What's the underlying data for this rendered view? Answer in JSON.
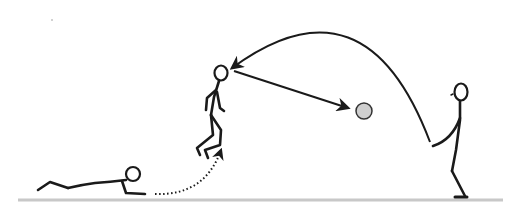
{
  "illustration": {
    "description": "Stick-figure sequence: a figure lying prone on the ground springs up (dotted path) into a jump, a ball is thrown in a high arc from a standing figure on the right to the jumping figure, who heads it forward toward the ball position.",
    "colors": {
      "background": "#ffffff",
      "stroke": "#1a1a1a",
      "ground": "#c8c8c8",
      "ball_fill": "#cfcfcf",
      "ball_stroke": "#333333"
    },
    "figures": [
      {
        "name": "lying-figure",
        "pose": "prone on ground"
      },
      {
        "name": "jumping-figure",
        "pose": "airborne, knees bent"
      },
      {
        "name": "throwing-figure",
        "pose": "standing, arm extended after throw"
      }
    ],
    "paths": [
      {
        "name": "dotted-rise-path",
        "style": "dotted",
        "from": "lying-figure",
        "to": "jumping-figure"
      },
      {
        "name": "throw-arc",
        "style": "solid curve with arrowhead",
        "from": "throwing-figure",
        "to": "jumping-figure"
      },
      {
        "name": "header-arrow",
        "style": "solid straight with arrowhead",
        "from": "jumping-figure",
        "to": "ball"
      }
    ]
  }
}
